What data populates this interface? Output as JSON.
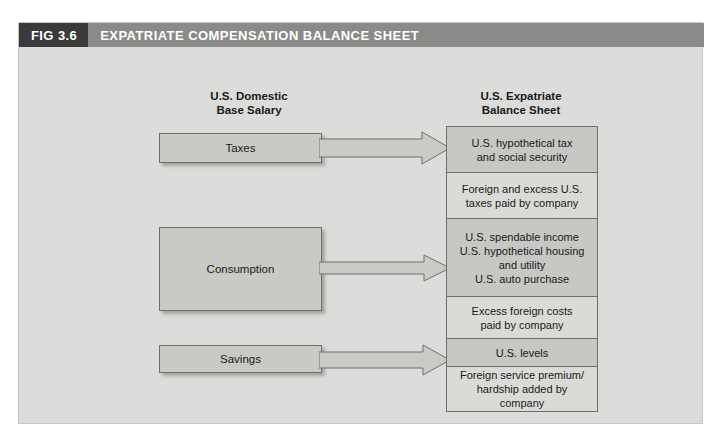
{
  "figure": {
    "number": "FIG 3.6",
    "title": "EXPATRIATE COMPENSATION BALANCE SHEET"
  },
  "columns": {
    "left": {
      "heading_line1": "U.S. Domestic",
      "heading_line2": "Base Salary",
      "boxes": [
        {
          "label": "Taxes"
        },
        {
          "label": "Consumption"
        },
        {
          "label": "Savings"
        }
      ]
    },
    "right": {
      "heading_line1": "U.S. Expatriate",
      "heading_line2": "Balance Sheet",
      "boxes": [
        {
          "lines": [
            "U.S. hypothetical tax",
            "and social security"
          ],
          "shade": "dark"
        },
        {
          "lines": [
            "Foreign and excess U.S.",
            "taxes paid by company"
          ],
          "shade": "light"
        },
        {
          "lines": [
            "U.S. spendable income",
            "U.S. hypothetical housing",
            "and utility",
            "U.S. auto purchase"
          ],
          "shade": "dark"
        },
        {
          "lines": [
            "Excess foreign costs",
            "paid by company"
          ],
          "shade": "light"
        },
        {
          "lines": [
            "U.S. levels"
          ],
          "shade": "dark"
        },
        {
          "lines": [
            "Foreign service premium/",
            "hardship added by company"
          ],
          "shade": "light"
        }
      ]
    }
  },
  "arrows": [
    {
      "name": "taxes-to-hypothetical-tax"
    },
    {
      "name": "consumption-to-spendable-income"
    },
    {
      "name": "savings-to-us-levels"
    }
  ],
  "colors": {
    "panel_background": "#dcdcda",
    "header_number_bg": "#3a3a3a",
    "header_title_bg": "#8a8a88",
    "box_fill_dark": "#c7c7c4",
    "box_fill_light": "#dadad6",
    "box_border": "#6e6e6c"
  }
}
